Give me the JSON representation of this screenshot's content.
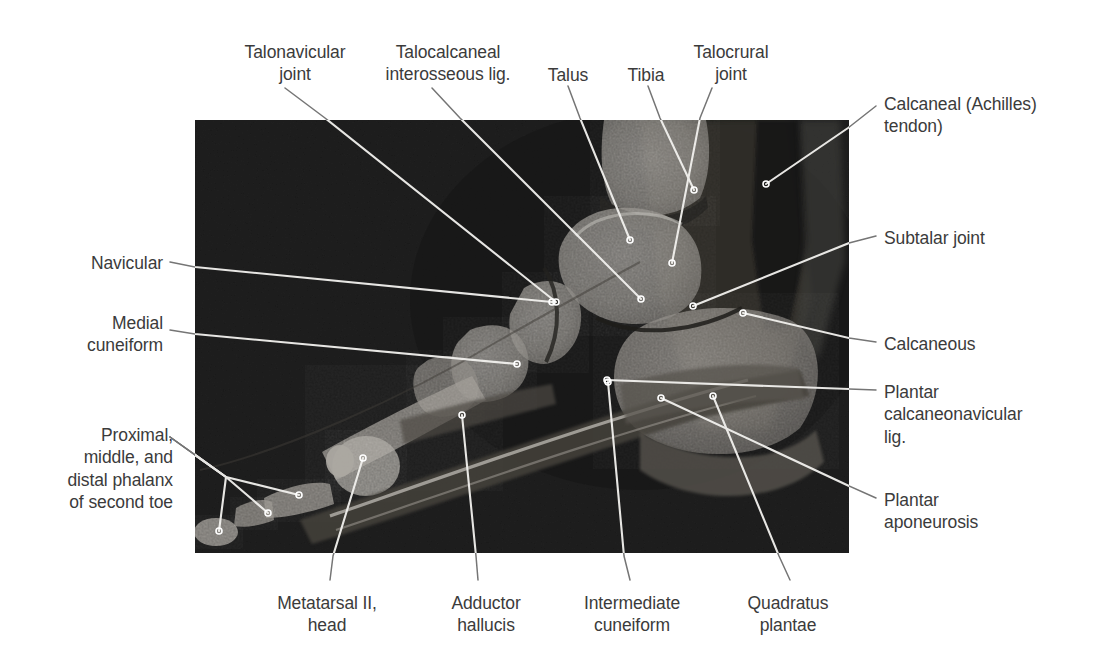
{
  "figure": {
    "kind": "labeled-anatomical-mri",
    "background_color": "#ffffff",
    "label_color": "#3b3b3b",
    "leader_color_outside": "#6e6e6e",
    "leader_color_inside": "#f0f0f0",
    "image_panel": {
      "x": 195,
      "y": 120,
      "width": 654,
      "height": 433,
      "base_color": "#141414"
    }
  },
  "labels": [
    {
      "id": "talonavicular-joint",
      "text": "Talonavicular\njoint",
      "align": "center",
      "x": 225,
      "y": 41,
      "width": 140
    },
    {
      "id": "talocalcaneal-interosseous-lig",
      "text": "Talocalcaneal\ninterosseous lig.",
      "align": "center",
      "x": 368,
      "y": 41,
      "width": 160
    },
    {
      "id": "talus",
      "text": "Talus",
      "align": "center",
      "x": 536,
      "y": 64,
      "width": 64
    },
    {
      "id": "tibia",
      "text": "Tibia",
      "align": "center",
      "x": 617,
      "y": 64,
      "width": 58
    },
    {
      "id": "talocrural-joint",
      "text": "Talocrural\njoint",
      "align": "center",
      "x": 676,
      "y": 41,
      "width": 110
    },
    {
      "id": "calcaneal-achilles-tendon",
      "text": "Calcaneal (Achilles)\ntendon)",
      "align": "left",
      "x": 884,
      "y": 93,
      "width": 210
    },
    {
      "id": "subtalar-joint",
      "text": "Subtalar joint",
      "align": "left",
      "x": 884,
      "y": 227,
      "width": 200
    },
    {
      "id": "calcaneous",
      "text": "Calcaneous",
      "align": "left",
      "x": 884,
      "y": 333,
      "width": 200
    },
    {
      "id": "plantar-calcaneonavicular-lig",
      "text": "Plantar\ncalcaneonavicular\nlig.",
      "align": "left",
      "x": 884,
      "y": 381,
      "width": 200
    },
    {
      "id": "plantar-aponeurosis",
      "text": "Plantar\naponeurosis",
      "align": "left",
      "x": 884,
      "y": 489,
      "width": 200
    },
    {
      "id": "navicular",
      "text": "Navicular",
      "align": "right",
      "x": 20,
      "y": 252,
      "width": 143
    },
    {
      "id": "medial-cuneiform",
      "text": "Medial\ncuneiform",
      "align": "right",
      "x": 20,
      "y": 312,
      "width": 143
    },
    {
      "id": "phalanges-second-toe",
      "text": "Proximal,\nmiddle, and\ndistal phalanx\nof second toe",
      "align": "right",
      "x": 20,
      "y": 424,
      "width": 153
    },
    {
      "id": "metatarsal-ii-head",
      "text": "Metatarsal II,\nhead",
      "align": "center",
      "x": 256,
      "y": 592,
      "width": 142
    },
    {
      "id": "adductor-hallucis",
      "text": "Adductor\nhallucis",
      "align": "center",
      "x": 430,
      "y": 592,
      "width": 112
    },
    {
      "id": "intermediate-cuneiform",
      "text": "Intermediate\ncuneiform",
      "align": "center",
      "x": 562,
      "y": 592,
      "width": 140
    },
    {
      "id": "quadratus-plantae",
      "text": "Quadratus\nplantae",
      "align": "center",
      "x": 728,
      "y": 592,
      "width": 120
    }
  ],
  "leaders": [
    {
      "id": "leader-talonavicular-joint",
      "points": "285,88 325,118 556,302",
      "dot": "556,302"
    },
    {
      "id": "leader-talocalcaneal-lig",
      "points": "432,88 460,118 641,299",
      "dot": "641,299"
    },
    {
      "id": "leader-talus",
      "points": "568,86 580,118 630,240",
      "dot": "630,240"
    },
    {
      "id": "leader-tibia",
      "points": "648,86 660,118 694,190",
      "dot": "694,190"
    },
    {
      "id": "leader-talocrural-joint",
      "points": "712,88 700,118 672,263",
      "dot": "672,263"
    },
    {
      "id": "leader-achilles-tendon",
      "points": "876,106 848,128 766,184",
      "dot": "766,184"
    },
    {
      "id": "leader-subtalar-joint",
      "points": "876,236 849,243 693,306",
      "dot": "693,306"
    },
    {
      "id": "leader-calcaneous",
      "points": "876,342 849,338 743,313",
      "dot": "743,313"
    },
    {
      "id": "leader-plantar-calcaneonav",
      "points": "876,390 849,389 607,380",
      "dot": "607,380"
    },
    {
      "id": "leader-plantar-aponeurosis",
      "points": "876,498 849,486 661,398",
      "dot": "661,398"
    },
    {
      "id": "leader-navicular",
      "points": "170,262 195,267 552,302",
      "dot": "552,302"
    },
    {
      "id": "leader-medial-cuneiform",
      "points": "170,330 195,334 517,364",
      "dot": "517,364"
    },
    {
      "id": "leader-phalanx-distal",
      "points": "170,437 226,477 219,531",
      "dot": "219,531"
    },
    {
      "id": "leader-phalanx-middle",
      "points": "170,437 226,477 268,513",
      "dot": "268,513"
    },
    {
      "id": "leader-phalanx-proximal",
      "points": "170,437 226,477 299,495",
      "dot": "299,495"
    },
    {
      "id": "leader-metatarsal-ii-head",
      "points": "330,580 333,556 363,458",
      "dot": "363,458"
    },
    {
      "id": "leader-adductor-hallucis",
      "points": "478,580 476,556 462,415",
      "dot": "462,415"
    },
    {
      "id": "leader-intermediate-cuneif",
      "points": "630,580 624,556 608,382",
      "dot": "608,382"
    },
    {
      "id": "leader-quadratus-plantae",
      "points": "790,580 779,556 713,396",
      "dot": "713,396"
    }
  ]
}
